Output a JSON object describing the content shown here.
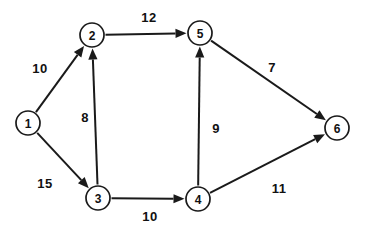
{
  "figure": {
    "width": 366,
    "height": 233,
    "background_color": "#ffffff",
    "stroke_color": "#1a1a1a",
    "text_color": "#111111"
  },
  "chart_data": {
    "type": "diagram",
    "diagram_type": "directed-weighted-graph",
    "title": "",
    "xlabel": "",
    "ylabel": "",
    "node_radius": 12,
    "directed": true,
    "nodes": [
      {
        "id": "1",
        "label": "1",
        "x": 28,
        "y": 123
      },
      {
        "id": "2",
        "label": "2",
        "x": 92,
        "y": 35
      },
      {
        "id": "3",
        "label": "3",
        "x": 98,
        "y": 198
      },
      {
        "id": "4",
        "label": "4",
        "x": 198,
        "y": 199
      },
      {
        "id": "5",
        "label": "5",
        "x": 200,
        "y": 33
      },
      {
        "id": "6",
        "label": "6",
        "x": 337,
        "y": 128
      }
    ],
    "edges": [
      {
        "from": "1",
        "to": "2",
        "weight": 10,
        "label": "10",
        "label_x": 40,
        "label_y": 68
      },
      {
        "from": "1",
        "to": "3",
        "weight": 15,
        "label": "15",
        "label_x": 45,
        "label_y": 183
      },
      {
        "from": "3",
        "to": "2",
        "weight": 8,
        "label": "8",
        "label_x": 85,
        "label_y": 117
      },
      {
        "from": "2",
        "to": "5",
        "weight": 12,
        "label": "12",
        "label_x": 149,
        "label_y": 17
      },
      {
        "from": "3",
        "to": "4",
        "weight": 10,
        "label": "10",
        "label_x": 150,
        "label_y": 216
      },
      {
        "from": "4",
        "to": "5",
        "weight": 9,
        "label": "9",
        "label_x": 216,
        "label_y": 128
      },
      {
        "from": "5",
        "to": "6",
        "weight": 7,
        "label": "7",
        "label_x": 272,
        "label_y": 67
      },
      {
        "from": "4",
        "to": "6",
        "weight": 11,
        "label": "11",
        "label_x": 279,
        "label_y": 188
      }
    ]
  }
}
